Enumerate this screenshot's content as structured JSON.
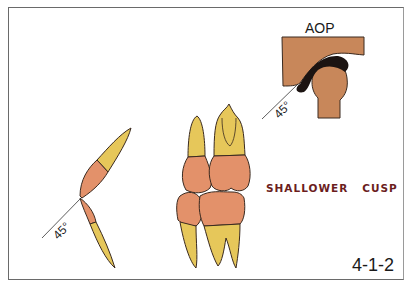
{
  "figure": {
    "id_label": "4-1-2",
    "caption": "SHALLOWER   CUSP",
    "joint_label": "AOP",
    "angle_labels": [
      "45°",
      "45°"
    ],
    "colors": {
      "enamel_crown": "#e3916a",
      "root": "#e6c75a",
      "fossa_bone": "#c8875a",
      "disc": "#1c1412",
      "outline": "#3a2a20",
      "caption_text": "#6b1d1d",
      "frame": "#6a6a6a"
    },
    "elements": [
      {
        "name": "tmj-cross-section",
        "description": "Articular eminence with condyle and dark disc, 45° guide line"
      },
      {
        "name": "incisor-pair",
        "description": "Upper and lower incisors meeting at 45° angle"
      },
      {
        "name": "molar-pair",
        "description": "Upper and lower molars in occlusion with shallow cusps"
      }
    ]
  }
}
